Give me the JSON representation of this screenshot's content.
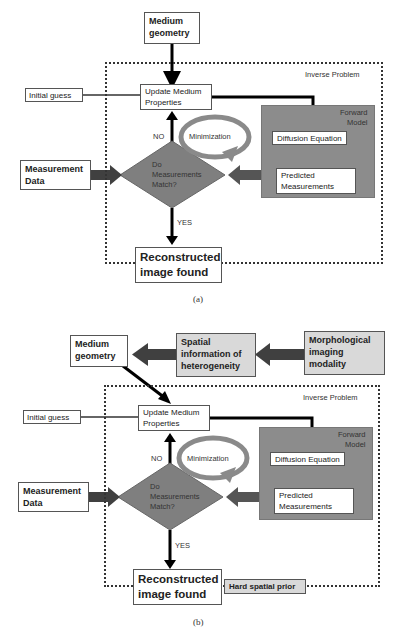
{
  "diagram_a": {
    "medium_geometry": [
      "Medium",
      "geometry"
    ],
    "inverse_problem_label": "Inverse Problem",
    "initial_guess": "Initial guess",
    "update_medium_properties": [
      "Update Medium",
      "Properties"
    ],
    "forward_model_label": [
      "Forward",
      "Model"
    ],
    "diffusion_equation": "Diffusion Equation",
    "predicted_measurements": [
      "Predicted",
      "Measurements"
    ],
    "minimization": "Minimization",
    "no_label": "NO",
    "yes_label": "YES",
    "decision": [
      "Do",
      "Measurements",
      "Match?"
    ],
    "measurement_data": [
      "Measurement",
      "Data"
    ],
    "reconstructed_image": [
      "Reconstructed",
      "image found"
    ],
    "caption": "(a)"
  },
  "diagram_b": {
    "medium_geometry": [
      "Medium",
      "geometry"
    ],
    "spatial_information": [
      "Spatial",
      "information of",
      "heterogeneity"
    ],
    "morphological_imaging": [
      "Morphological",
      "imaging",
      "modality"
    ],
    "inverse_problem_label": "Inverse Problem",
    "initial_guess": "Initial guess",
    "update_medium_properties": [
      "Update Medium",
      "Properties"
    ],
    "forward_model_label": [
      "Forward",
      "Model"
    ],
    "diffusion_equation": "Diffusion Equation",
    "predicted_measurements": [
      "Predicted",
      "Measurements"
    ],
    "minimization": "Minimization",
    "no_label": "NO",
    "yes_label": "YES",
    "decision": [
      "Do",
      "Measurements",
      "Match?"
    ],
    "measurement_data": [
      "Measurement",
      "Data"
    ],
    "reconstructed_image": [
      "Reconstructed",
      "image found"
    ],
    "hard_spatial_prior": "Hard spatial prior",
    "caption": "(b)"
  },
  "colors": {
    "forward_model_fill": "#8c8c8c",
    "diamond_fill": "#7f7f7f",
    "wide_arrow": "#404040",
    "minimization_ring": "#8a8a8a",
    "prior_box_fill": "#d9d9d9"
  }
}
